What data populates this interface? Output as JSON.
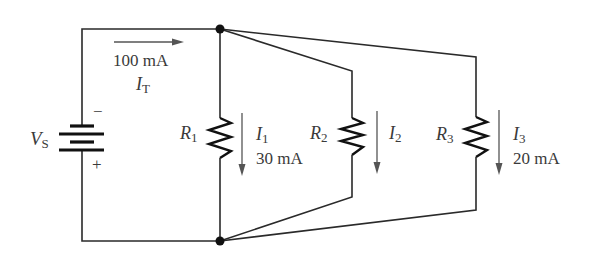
{
  "diagram": {
    "type": "parallel-circuit",
    "source": {
      "label_main": "V",
      "label_sub": "S",
      "minus": "−",
      "plus": "+"
    },
    "total_current": {
      "value": "100 mA",
      "label_main": "I",
      "label_sub": "T"
    },
    "branches": [
      {
        "resistor_main": "R",
        "resistor_sub": "1",
        "current_main": "I",
        "current_sub": "1",
        "current_value": "30 mA"
      },
      {
        "resistor_main": "R",
        "resistor_sub": "2",
        "current_main": "I",
        "current_sub": "2",
        "current_value": ""
      },
      {
        "resistor_main": "R",
        "resistor_sub": "3",
        "current_main": "I",
        "current_sub": "3",
        "current_value": "20 mA"
      }
    ],
    "colors": {
      "wire": "#2a2a2a",
      "text": "#3a3a3a",
      "arrow": "#555555"
    }
  }
}
